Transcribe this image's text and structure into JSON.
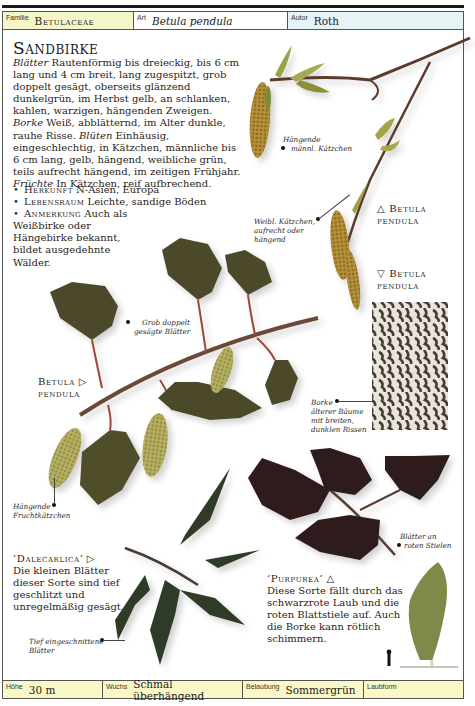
{
  "header": {
    "familie_label": "Familie",
    "familie_value": "Betulaceae",
    "art_label": "Art",
    "art_value": "Betula pendula",
    "autor_label": "Autor",
    "autor_value": "Roth",
    "colors": {
      "familie_bg": "#f4f6c8",
      "art_bg": "#ffffff",
      "autor_bg": "#e6f3f7"
    }
  },
  "main": {
    "title": "Sandbirke",
    "description": {
      "blaetter_key": "Blätter",
      "blaetter_text": " Rautenförmig bis dreieckig, bis 6 cm lang und 4 cm breit, lang zugespitzt, grob doppelt gesägt, oberseits glänzend dunkelgrün, im Herbst gelb, an schlanken, kahlen, warzigen, hängenden Zweigen. ",
      "borke_key": "Borke",
      "borke_text": " Weiß, abblätternd, im Alter dunkle, rauhe Risse. ",
      "blueten_key": "Blüten",
      "blueten_text": " Einhäusig, eingeschlechtig, in Kätzchen, männliche bis 6 cm lang, gelb, hängend, weibliche grün, teils aufrecht hängend, im zeitigen Frühjahr. ",
      "fruechte_key": "Früchte",
      "fruechte_text": " In Kätzchen, reif aufbrechend."
    },
    "bullets": [
      {
        "key": "Herkunft",
        "text": " N-Asien, Europa"
      },
      {
        "key": "Lebensraum",
        "text": " Leichte, sandige Böden"
      },
      {
        "key": "Anmerkung",
        "text": " Auch als",
        "continuation": "Weißbirke oder Hängebirke bekannt, bildet ausgedehnte Wälder."
      }
    ]
  },
  "captions": {
    "maennl_kaetzchen": [
      "Hängende",
      "männl. Kätzchen"
    ],
    "weibl_kaetzchen": [
      "Weibl. Kätzchen,",
      "aufrecht oder",
      "hängend"
    ],
    "grob_gesaegt": [
      "Grob doppelt",
      "gesägte Blätter"
    ],
    "borke": [
      "Borke",
      "älterer Bäume",
      "mit breiten,",
      "dunklen Rissen"
    ],
    "fruchtkaetzchen": [
      "Hängende",
      "Fruchtkätzchen"
    ],
    "roten_stielen": [
      "Blätter an",
      "roten Stielen"
    ],
    "tief_eingeschnitten": [
      "Tief eingeschnittene",
      "Blätter"
    ]
  },
  "species_labels": [
    {
      "id": "upper",
      "arrow": "△",
      "line1": "Betula",
      "line2": "pendula"
    },
    {
      "id": "bark",
      "arrow": "▽",
      "line1": "Betula",
      "line2": "pendula"
    },
    {
      "id": "branch",
      "arrow": "▷",
      "line1": "Betula",
      "line2": "pendula"
    }
  ],
  "varieties": [
    {
      "name": "‘Dalecarlica’",
      "arrow": "▷",
      "text": "Die kleinen Blätter dieser Sorte sind tief geschlitzt und unregelmäßig gesägt."
    },
    {
      "name": "‘Purpurea’",
      "arrow": "△",
      "text": "Diese Sorte fällt durch das schwarzrote Laub und die roten Blattstiele auf. Auch die Borke kann rötlich schimmern."
    }
  ],
  "footer": {
    "hoehe_label": "Höhe",
    "hoehe_value": "30 m",
    "wuchs_label": "Wuchs",
    "wuchs_value": "Schmal überhängend",
    "belaubung_label": "Belaubung",
    "belaubung_value": "Sommergrün",
    "laubform_label": "Laubform",
    "laubform_icon": "leaf-sprig-icon",
    "bg_color": "#fbf8c8"
  }
}
